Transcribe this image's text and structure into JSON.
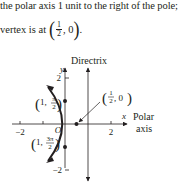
{
  "text": {
    "line1": "the polar axis 1 unit to the right of the pole;",
    "line2_prefix": "vertex is at",
    "line2_frac_num": "1",
    "line2_frac_den": "2",
    "line2_suffix": ", 0",
    "line2_end": "."
  },
  "diagram": {
    "directrix_label": "Directrix",
    "y_axis_label": "y",
    "x_axis_label": "x",
    "polar_label_1": "Polar",
    "polar_label_2": "axis",
    "origin_label": "O",
    "tick_x_neg2": "−2",
    "tick_x_2": "2",
    "tick_y_2": "2",
    "tick_y_neg2": "−2",
    "point_top_label_r": "1,",
    "point_top_label_theta": "π",
    "point_top_label_den": "2",
    "point_bottom_label_r": "1,",
    "point_bottom_label_theta": "3π",
    "point_bottom_label_den": "2",
    "vertex_label_num": "1",
    "vertex_label_den": "2",
    "vertex_label_rest": ", 0",
    "colors": {
      "ink": "#231f20",
      "background": "#ffffff"
    }
  }
}
